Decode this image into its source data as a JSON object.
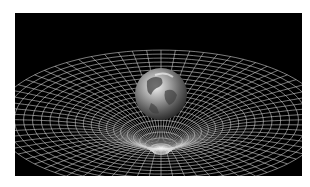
{
  "image": {
    "subject": "Earth warping a spacetime grid (gravity well illustration)",
    "background_color": "#000000",
    "grid_color": "#d8d8d8",
    "page_background": "#ffffff"
  }
}
